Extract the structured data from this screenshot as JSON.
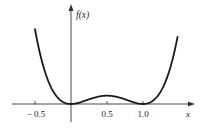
{
  "chart_data": {
    "type": "line",
    "title": "",
    "function": "f(x) = x^2 (x - 1)^2",
    "xlabel": "x",
    "ylabel": "f(x)",
    "x_ticks": [
      -0.5,
      0.5,
      1.0
    ],
    "x_tick_labels": [
      "− 0.5",
      "0.5",
      "1.0"
    ],
    "y_ticks": [],
    "grid": false,
    "legend": null,
    "xlim": [
      -0.75,
      1.72
    ],
    "ylim": [
      -0.1,
      0.75
    ],
    "series": [
      {
        "name": "f(x)",
        "x": [
          -0.5,
          -0.4,
          -0.3,
          -0.2,
          -0.1,
          0,
          0.1,
          0.2,
          0.3,
          0.4,
          0.5,
          0.6,
          0.7,
          0.8,
          0.9,
          1.0,
          1.1,
          1.2,
          1.3,
          1.4,
          1.48
        ],
        "y": [
          0.5625,
          0.3136,
          0.1521,
          0.0576,
          0.0121,
          0,
          0.0081,
          0.0256,
          0.0441,
          0.0576,
          0.0625,
          0.0576,
          0.0441,
          0.0256,
          0.0081,
          0,
          0.0121,
          0.0576,
          0.1521,
          0.3136,
          0.5308
        ]
      }
    ],
    "annotations": [
      "local minima at x = 0 and x = 1",
      "local maximum at x = 0.5"
    ]
  },
  "axes": {
    "x_label": "x",
    "y_label": "f(x)",
    "tick_labels": [
      "− 0.5",
      "0.5",
      "1.0"
    ]
  },
  "style": {
    "curve_color": "#1a1a1a",
    "axis_color": "#333333",
    "background": "#ffffff"
  }
}
